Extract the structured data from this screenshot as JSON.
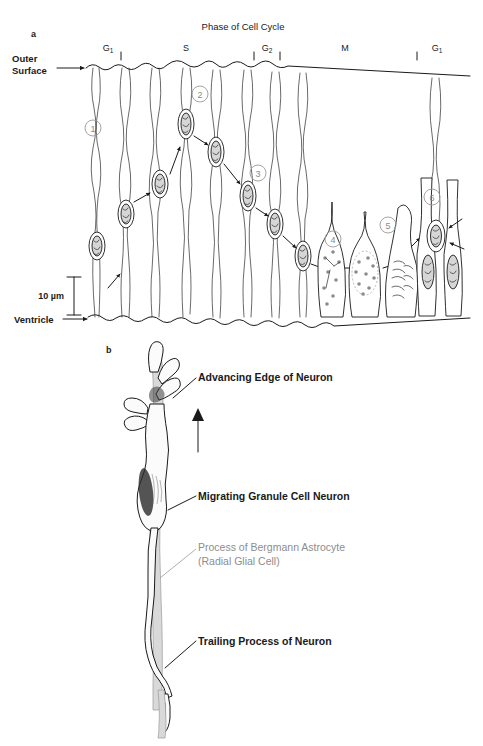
{
  "figure": {
    "panel_a": {
      "panel_letter": "a",
      "title": "Phase of Cell Cycle",
      "phases": [
        {
          "label": "G",
          "sub": "1",
          "x": 108
        },
        {
          "label": "S",
          "sub": "",
          "x": 186
        },
        {
          "label": "G",
          "sub": "2",
          "x": 267
        },
        {
          "label": "M",
          "sub": "",
          "x": 345
        },
        {
          "label": "G",
          "sub": "1",
          "x": 437
        }
      ],
      "phase_ticks": [
        121,
        254,
        280,
        417
      ],
      "top_label_line1": "Outer",
      "top_label_line2": "Surface",
      "bottom_label": "Ventricle",
      "scale_bar_label": "10 µm",
      "step_numbers": [
        {
          "n": "1",
          "x": 93,
          "y": 128
        },
        {
          "n": "2",
          "x": 200,
          "y": 94
        },
        {
          "n": "3",
          "x": 258,
          "y": 173
        },
        {
          "n": "4",
          "x": 333,
          "y": 239
        },
        {
          "n": "5",
          "x": 388,
          "y": 225
        },
        {
          "n": "6",
          "x": 432,
          "y": 197
        }
      ]
    },
    "panel_b": {
      "panel_letter": "b",
      "annotations": [
        {
          "id": "advancing-edge",
          "text": "Advancing Edge of Neuron",
          "style": "bold-black",
          "text_x": 198,
          "text_y": 381
        },
        {
          "id": "migrating-neuron",
          "text": "Migrating Granule Cell Neuron",
          "style": "bold-black",
          "text_x": 198,
          "text_y": 500
        },
        {
          "id": "bergmann-astrocyte-line1",
          "text": "Process of Bergmann Astrocyte",
          "style": "gray",
          "text_x": 198,
          "text_y": 551
        },
        {
          "id": "bergmann-astrocyte-line2",
          "text": "(Radial Glial Cell)",
          "style": "gray",
          "text_x": 198,
          "text_y": 565
        },
        {
          "id": "trailing-process",
          "text": "Trailing Process of Neuron",
          "style": "bold-black",
          "text_x": 198,
          "text_y": 645
        }
      ],
      "direction_arrow": "up-arrow"
    }
  },
  "colors": {
    "ink": "#1a1a1a",
    "gray_label": "#8d8d8d",
    "glia_gray": "#d9d9d9",
    "nucleus_gray": "#d6d6d6",
    "circle_outline": "#9a9a9a"
  }
}
